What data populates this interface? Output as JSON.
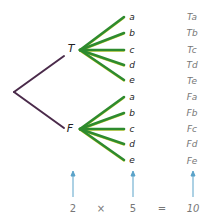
{
  "diagram": {
    "type": "tree-diagram",
    "colors": {
      "root_branch": "#4a2a4a",
      "leaf_branch": "#2e8b2e",
      "leaf_highlight": "#d8d23a",
      "arrow": "#5ba3c9",
      "result_text": "#777777",
      "equation_text": "#777777"
    },
    "root": {
      "x": 14,
      "y": 92
    },
    "nodes": [
      {
        "label": "T",
        "x": 70,
        "y": 49,
        "hub": {
          "x": 80,
          "y": 50
        },
        "leaves": [
          {
            "label": "a",
            "y": 17,
            "result": "Ta"
          },
          {
            "label": "b",
            "y": 33,
            "result": "Tb"
          },
          {
            "label": "c",
            "y": 50,
            "result": "Tc"
          },
          {
            "label": "d",
            "y": 65,
            "result": "Td"
          },
          {
            "label": "e",
            "y": 80,
            "result": "Te"
          }
        ]
      },
      {
        "label": "F",
        "x": 70,
        "y": 129,
        "hub": {
          "x": 80,
          "y": 129
        },
        "leaves": [
          {
            "label": "a",
            "y": 97,
            "result": "Fa"
          },
          {
            "label": "b",
            "y": 113,
            "result": "Fb"
          },
          {
            "label": "c",
            "y": 129,
            "result": "Fc"
          },
          {
            "label": "d",
            "y": 144,
            "result": "Fd"
          },
          {
            "label": "e",
            "y": 160,
            "result": "Fe"
          }
        ]
      }
    ],
    "equation": {
      "factor1": "2",
      "times": "×",
      "factor2": "5",
      "equals": "=",
      "product": "10"
    }
  }
}
